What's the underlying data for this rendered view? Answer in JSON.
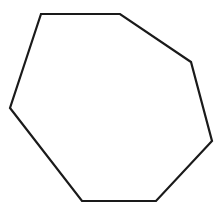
{
  "figure": {
    "shape": "heptagon",
    "sides": 7,
    "background": "#ffffff",
    "stroke_color": "#1a1a1a",
    "stroke_width": 2.2,
    "fill": "none",
    "vertices": [
      [
        41,
        14
      ],
      [
        120,
        14
      ],
      [
        191,
        62
      ],
      [
        212,
        141
      ],
      [
        156,
        201
      ],
      [
        82,
        201
      ],
      [
        10,
        108
      ]
    ]
  }
}
